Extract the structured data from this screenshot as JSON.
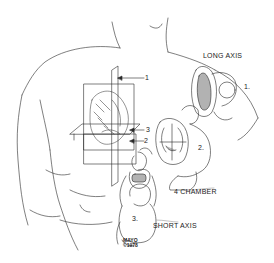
{
  "figure": {
    "type": "medical-illustration",
    "background": "#ffffff",
    "ink": "#2a2a2a"
  },
  "labels": {
    "long_axis": "LONG AXIS",
    "four_chamber": "4 CHAMBER",
    "short_axis": "SHORT AXIS"
  },
  "plane_markers": {
    "plane_1": "1",
    "plane_2": "2",
    "plane_3": "3"
  },
  "view_numbers": {
    "long_axis_view": "1.",
    "four_chamber_view": "2.",
    "short_axis_view": "3."
  },
  "signature": {
    "line1": "MAYO",
    "line2": "©1978"
  }
}
